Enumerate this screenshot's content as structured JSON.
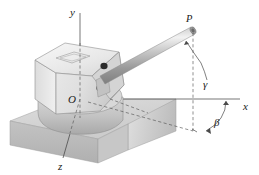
{
  "figure": {
    "kind": "engineering-diagram",
    "background_color": "#ffffff"
  },
  "axes": {
    "y": {
      "label": "y"
    },
    "x": {
      "label": "x"
    },
    "z": {
      "label": "z"
    },
    "origin": {
      "label": "O"
    },
    "line_color": "#3c3c3c"
  },
  "points": {
    "p": {
      "label": "P"
    }
  },
  "angles": {
    "gamma": {
      "label": "γ"
    },
    "beta": {
      "label": "β"
    }
  },
  "colors": {
    "slab_top": "#d6d6d6",
    "slab_front": "#b9b9b9",
    "slab_right": "#cfcfcf",
    "turret_top": "#ededed",
    "turret_front": "#e3e3e3",
    "turret_side": "#d2d2d2",
    "turret_skirt": "#c6c6c6",
    "barrel_light": "#efefef",
    "barrel_mid": "#b6b6b6",
    "barrel_dark": "#8d8d8d",
    "outline": "#8a8a8a",
    "dash": "#555555",
    "mount_dark": "#2b2b2b"
  }
}
